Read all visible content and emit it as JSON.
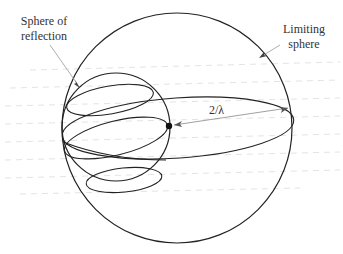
{
  "figure": {
    "labels": {
      "sphere_of_reflection_line1": "Sphere of",
      "sphere_of_reflection_line2": "reflection",
      "limiting_sphere_line1": "Limiting",
      "limiting_sphere_line2": "sphere",
      "radius_label": "2/λ"
    },
    "shapes": {
      "limiting_sphere": {
        "cx": 177,
        "cy": 128,
        "r": 115
      },
      "reflection_sphere": {
        "cx": 116,
        "cy": 128,
        "r": 54
      },
      "origin_dot": {
        "cx": 169,
        "cy": 126
      }
    },
    "colors": {
      "stroke": "#222222",
      "text": "#333333",
      "leader": "#999999"
    }
  }
}
